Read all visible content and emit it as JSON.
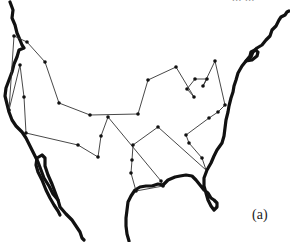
{
  "figure": {
    "caption": "(a)",
    "top_cut_text": "... ...",
    "colors": {
      "coastline": "#111111",
      "route": "#333333",
      "node": "#111111",
      "background": "#ffffff"
    },
    "nodes": [
      [
        27,
        42
      ],
      [
        45,
        62
      ],
      [
        59,
        103
      ],
      [
        90,
        115
      ],
      [
        138,
        114
      ],
      [
        148,
        80
      ],
      [
        176,
        67
      ],
      [
        194,
        97
      ],
      [
        187,
        89
      ],
      [
        195,
        79
      ],
      [
        207,
        79
      ],
      [
        203,
        86
      ],
      [
        215,
        61
      ],
      [
        225,
        105
      ],
      [
        218,
        112
      ],
      [
        209,
        118
      ],
      [
        186,
        135
      ],
      [
        189,
        143
      ],
      [
        202,
        158
      ],
      [
        206,
        170
      ],
      [
        158,
        127
      ],
      [
        133,
        145
      ],
      [
        132,
        160
      ],
      [
        131,
        173
      ],
      [
        136,
        191
      ],
      [
        163,
        186
      ],
      [
        161,
        181
      ],
      [
        108,
        117
      ],
      [
        101,
        136
      ],
      [
        98,
        157
      ],
      [
        78,
        145
      ],
      [
        26,
        133
      ],
      [
        24,
        97
      ],
      [
        20,
        65
      ],
      [
        9,
        110
      ],
      [
        14,
        36
      ]
    ]
  }
}
